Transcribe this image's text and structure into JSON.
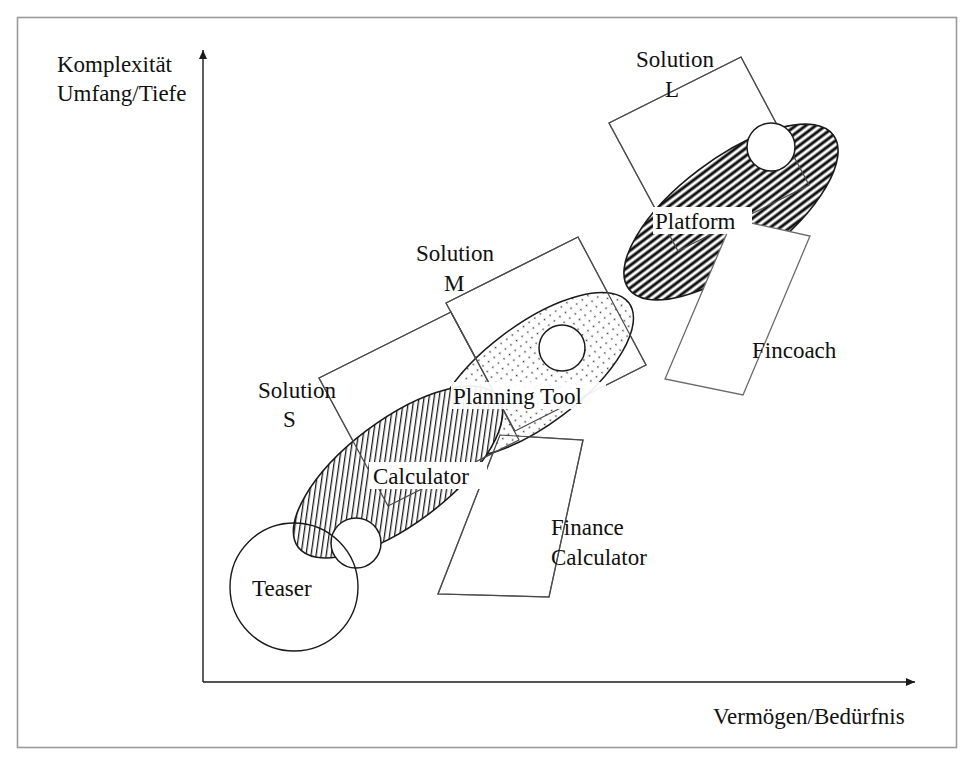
{
  "figure": {
    "type": "diagram"
  },
  "axes": {
    "y": {
      "line1": "Komplexität",
      "line2": "Umfang/Tiefe",
      "arrow_icon": "arrow-up-icon"
    },
    "x": {
      "label": "Vermögen/Bedürfnis",
      "arrow_icon": "arrow-right-icon"
    }
  },
  "teaser": {
    "label": "Teaser"
  },
  "ellipses": [
    {
      "id": "calculator",
      "label": "Calculator",
      "fill": "diagonal-hatch"
    },
    {
      "id": "planning-tool",
      "label": "Planning Tool",
      "fill": "dotted-stipple"
    },
    {
      "id": "platform",
      "label": "Platform",
      "fill": "horizontal-hatch"
    }
  ],
  "solution_bands": [
    {
      "id": "solution-s",
      "line1": "Solution",
      "line2": "S"
    },
    {
      "id": "solution-m",
      "line1": "Solution",
      "line2": "M"
    },
    {
      "id": "solution-l",
      "line1": "Solution",
      "line2": "L"
    }
  ],
  "product_bands": [
    {
      "id": "finance-calculator",
      "line1": "Finance",
      "line2": "Calculator"
    },
    {
      "id": "fincoach",
      "line1": "Fincoach",
      "line2": ""
    }
  ],
  "colors": {
    "stroke": "#202020",
    "frame": "#808080",
    "background": "#ffffff",
    "hatch": "#1a1a1a"
  }
}
